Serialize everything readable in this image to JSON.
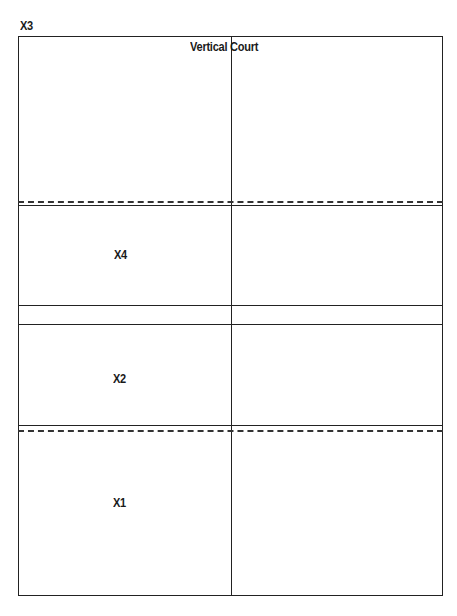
{
  "diagram": {
    "corner_label": "X3",
    "title": "Vertical Court",
    "zones": [
      {
        "label": "X4"
      },
      {
        "label": "X2"
      },
      {
        "label": "X1"
      }
    ]
  }
}
